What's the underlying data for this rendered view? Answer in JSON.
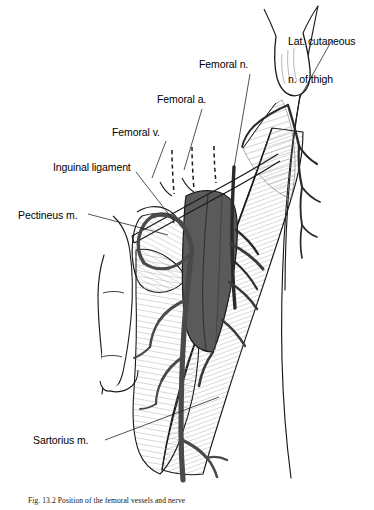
{
  "figure": {
    "title": "Position of the femoral vessels and nerve",
    "caption_number": "Fig. 13.2",
    "caption_text": "Fig. 13.2  Position of the femoral vessels and nerve",
    "background_color": "#ffffff",
    "ink_color": "#1a1a1a",
    "vessel_fill": "#5a5a5a",
    "vein_fill": "#4a4a4a",
    "muscle_hatch": "#777777",
    "width": 374,
    "height": 510
  },
  "labels": [
    {
      "id": "lat-cutaneous-nerve",
      "text": "Lat. cutaneous\nn. of thigh",
      "line1": "Lat. cutaneous",
      "line2": "n. of thigh",
      "x": 288,
      "y": 10,
      "align": "left"
    },
    {
      "id": "femoral-nerve",
      "text": "Femoral n.",
      "x": 199,
      "y": 58,
      "align": "left"
    },
    {
      "id": "femoral-artery",
      "text": "Femoral a.",
      "x": 157,
      "y": 93,
      "align": "left"
    },
    {
      "id": "femoral-vein",
      "text": "Femoral v.",
      "x": 112,
      "y": 126,
      "align": "left"
    },
    {
      "id": "inguinal-ligament",
      "text": "Inguinal ligament",
      "x": 53,
      "y": 161,
      "align": "left"
    },
    {
      "id": "pectineus-muscle",
      "text": "Pectineus m.",
      "x": 18,
      "y": 209,
      "align": "left"
    },
    {
      "id": "sartorius-muscle",
      "text": "Sartorius m.",
      "x": 33,
      "y": 434,
      "align": "left"
    }
  ],
  "leader_lines": [
    {
      "id": "leader-lat-cutaneous",
      "from": [
        330,
        38
      ],
      "to": [
        300,
        97
      ]
    },
    {
      "id": "leader-femoral-nerve",
      "from": [
        248,
        74
      ],
      "to": [
        233,
        166
      ]
    },
    {
      "id": "leader-femoral-artery",
      "from": [
        200,
        109
      ],
      "to": [
        183,
        165
      ]
    },
    {
      "id": "leader-femoral-vein",
      "from": [
        166,
        141
      ],
      "to": [
        152,
        170
      ]
    },
    {
      "id": "leader-inguinal-ligament",
      "from": [
        137,
        172
      ],
      "to": [
        173,
        219
      ]
    },
    {
      "id": "leader-pectineus",
      "from": [
        87,
        214
      ],
      "to": [
        166,
        234
      ]
    },
    {
      "id": "leader-sartorius",
      "from": [
        104,
        440
      ],
      "to": [
        218,
        398
      ]
    }
  ],
  "structures": [
    {
      "id": "thigh-outline",
      "name": "thigh-outline"
    },
    {
      "id": "asis-hook",
      "name": "anterior-superior-iliac-spine"
    },
    {
      "id": "inguinal-ligament-band",
      "name": "inguinal-ligament-band"
    },
    {
      "id": "sartorius-muscle-belly",
      "name": "sartorius-muscle-belly"
    },
    {
      "id": "pectineus-muscle-belly",
      "name": "pectineus-muscle-belly"
    },
    {
      "id": "adductor-mass",
      "name": "adductor-muscle-mass"
    },
    {
      "id": "femoral-vessel-sheath",
      "name": "femoral-vessel-sheath"
    },
    {
      "id": "femoral-vein-trunk",
      "name": "femoral-vein-trunk"
    },
    {
      "id": "femoral-artery-trunk",
      "name": "femoral-artery-trunk"
    },
    {
      "id": "great-saphenous-vein",
      "name": "great-saphenous-vein"
    },
    {
      "id": "lat-cutaneous-nerve-branches",
      "name": "lateral-cutaneous-nerve-branches"
    },
    {
      "id": "cut-vessel-marks",
      "name": "cut-vessel-dashed-marks"
    },
    {
      "id": "genital-outline",
      "name": "genital-region-outline"
    }
  ]
}
